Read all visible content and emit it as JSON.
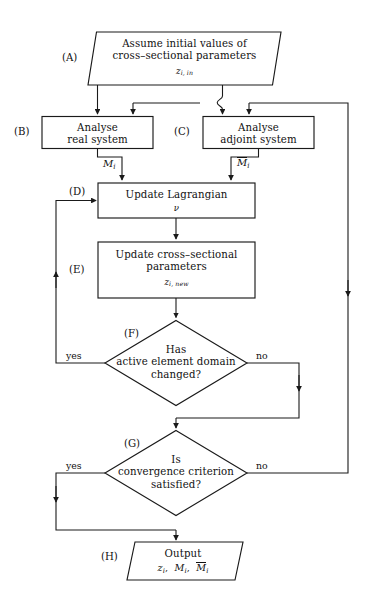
{
  "diagram": {
    "type": "flowchart",
    "nodes": [
      {
        "id": "A",
        "tag": "(A)",
        "shape": "parallelogram",
        "role": "input",
        "line1": "Assume initial values of",
        "line2": "cross–sectional parameters",
        "sub": "z",
        "sub_index": "i, in"
      },
      {
        "id": "B",
        "tag": "(B)",
        "shape": "rectangle",
        "role": "process",
        "line1": "Analyse",
        "line2": "real system"
      },
      {
        "id": "C",
        "tag": "(C)",
        "shape": "rectangle",
        "role": "process",
        "line1": "Analyse",
        "line2": "adjoint system"
      },
      {
        "id": "D",
        "tag": "(D)",
        "shape": "rectangle",
        "role": "process",
        "line1": "Update Lagrangian",
        "sub": "ν"
      },
      {
        "id": "E",
        "tag": "(E)",
        "shape": "rectangle",
        "role": "process",
        "line1": "Update cross–sectional",
        "line2": "parameters",
        "sub": "z",
        "sub_index": "i, new"
      },
      {
        "id": "F",
        "tag": "(F)",
        "shape": "diamond",
        "role": "decision",
        "line1": "Has",
        "line2": "active element domain",
        "line3": "changed?"
      },
      {
        "id": "G",
        "tag": "(G)",
        "shape": "diamond",
        "role": "decision",
        "line1": "Is",
        "line2": "convergence criterion",
        "line3": "satisfied?"
      },
      {
        "id": "H",
        "tag": "(H)",
        "shape": "parallelogram",
        "role": "output",
        "line1": "Output",
        "line2": "z_i,  M_i,  M̄_i"
      }
    ],
    "edge_labels": {
      "b_to_d": "M",
      "b_to_d_index": "i",
      "c_to_d": "M",
      "c_to_d_index": "i",
      "f_yes": "yes",
      "f_no": "no",
      "g_yes": "yes",
      "g_no": "no"
    },
    "output_symbols": {
      "z": "z",
      "z_index": "i",
      "m": "M",
      "m_index": "i",
      "mbar": "M",
      "mbar_index": "i"
    },
    "colors": {
      "stroke": "#1a1a1a",
      "fill": "#ffffff",
      "text": "#111111",
      "background": "#ffffff"
    }
  }
}
